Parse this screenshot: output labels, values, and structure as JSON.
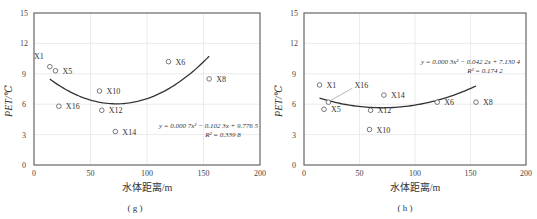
{
  "chart_data": [
    {
      "id": "g",
      "type": "scatter",
      "caption": "( g )",
      "xlabel": "水体距离/m",
      "ylabel": "PET/℃",
      "xlim": [
        0,
        200
      ],
      "ylim": [
        0,
        15
      ],
      "xticks": [
        0,
        50,
        100,
        150,
        200
      ],
      "yticks": [
        0,
        3,
        6,
        9,
        12,
        15
      ],
      "grid": true,
      "points": [
        {
          "label": "X1",
          "x": 14,
          "y": 9.7
        },
        {
          "label": "X5",
          "x": 19,
          "y": 9.3
        },
        {
          "label": "X16",
          "x": 22,
          "y": 5.8
        },
        {
          "label": "X10",
          "x": 58,
          "y": 7.3
        },
        {
          "label": "X12",
          "x": 60,
          "y": 5.4
        },
        {
          "label": "X14",
          "x": 72,
          "y": 3.3
        },
        {
          "label": "X6",
          "x": 119,
          "y": 10.2
        },
        {
          "label": "X8",
          "x": 155,
          "y": 8.5
        }
      ],
      "trendline": {
        "type": "polynomial",
        "order": 2,
        "a": 0.0007,
        "b": -0.1023,
        "c": 9.7765,
        "x_range": [
          14,
          155
        ]
      },
      "equation": "y = 0.000 7x² − 0.102 3x + 9.776 5",
      "r2": "R² = 0.339 8"
    },
    {
      "id": "h",
      "type": "scatter",
      "caption": "( h )",
      "xlabel": "水体距离/m",
      "ylabel": "PET/℃",
      "xlim": [
        0,
        200
      ],
      "ylim": [
        0,
        15
      ],
      "xticks": [
        0,
        50,
        100,
        150,
        200
      ],
      "yticks": [
        0,
        3,
        6,
        9,
        12,
        15
      ],
      "grid": true,
      "points": [
        {
          "label": "X1",
          "x": 14,
          "y": 7.9
        },
        {
          "label": "X16",
          "x": 22,
          "y": 6.2
        },
        {
          "label": "X5",
          "x": 18,
          "y": 5.5
        },
        {
          "label": "X14",
          "x": 72,
          "y": 6.9
        },
        {
          "label": "X12",
          "x": 60,
          "y": 5.4
        },
        {
          "label": "X10",
          "x": 59,
          "y": 3.5
        },
        {
          "label": "X6",
          "x": 120,
          "y": 6.2
        },
        {
          "label": "X8",
          "x": 155,
          "y": 6.2
        }
      ],
      "trendline": {
        "type": "polynomial",
        "order": 2,
        "a": 0.0003,
        "b": -0.0422,
        "c": 7.1304,
        "x_range": [
          14,
          155
        ]
      },
      "equation": "y = 0.000 3x² − 0.042 2x + 7.130 4",
      "r2": "R² = 0.174 2"
    }
  ]
}
